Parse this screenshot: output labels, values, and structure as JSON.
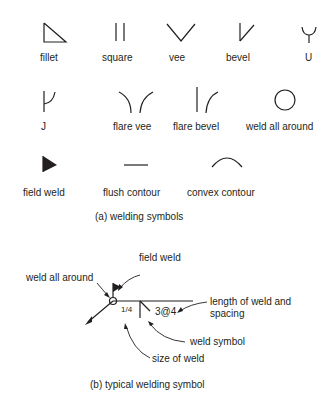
{
  "part_a": {
    "caption": "(a) welding symbols",
    "symbols": [
      {
        "label": "fillet",
        "icon": "fillet-symbol-icon"
      },
      {
        "label": "square",
        "icon": "square-symbol-icon"
      },
      {
        "label": "vee",
        "icon": "vee-symbol-icon"
      },
      {
        "label": "bevel",
        "icon": "bevel-symbol-icon"
      },
      {
        "label": "U",
        "icon": "u-symbol-icon"
      },
      {
        "label": "J",
        "icon": "j-symbol-icon"
      },
      {
        "label": "flare vee",
        "icon": "flare-vee-symbol-icon"
      },
      {
        "label": "flare bevel",
        "icon": "flare-bevel-symbol-icon"
      },
      {
        "label": "weld all around",
        "icon": "weld-all-around-symbol-icon"
      },
      {
        "label": "field weld",
        "icon": "field-weld-symbol-icon"
      },
      {
        "label": "flush contour",
        "icon": "flush-contour-symbol-icon"
      },
      {
        "label": "convex contour",
        "icon": "convex-contour-symbol-icon"
      }
    ]
  },
  "part_b": {
    "caption": "(b) typical welding symbol",
    "annotations": {
      "field_weld": "field weld",
      "weld_all_around": "weld all around",
      "length_line1": "length of weld and",
      "length_line2": "spacing",
      "weld_symbol": "weld symbol",
      "size_of_weld": "size of weld"
    },
    "values": {
      "size": "1/4",
      "length_spacing": "3@4"
    }
  },
  "colors": {
    "ink": "#231f20",
    "background": "#ffffff"
  }
}
